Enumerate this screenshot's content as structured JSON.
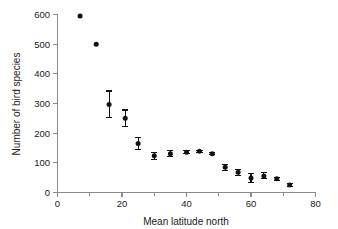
{
  "chart_data": {
    "type": "scatter",
    "title": "",
    "xlabel": "Mean latitude north",
    "ylabel": "Number of bird species",
    "xlim": [
      0,
      80
    ],
    "ylim": [
      0,
      600
    ],
    "grid": false,
    "legend": null,
    "x_ticks": [
      0,
      20,
      40,
      60,
      80
    ],
    "x_tick_labels": [
      "0",
      "20",
      "40",
      "60",
      "80"
    ],
    "x_minor_ticks": [
      10,
      30,
      50,
      70
    ],
    "y_ticks": [
      0,
      100,
      200,
      300,
      400,
      500,
      600
    ],
    "y_tick_labels": [
      "0",
      "100",
      "200",
      "300",
      "400",
      "500",
      "600"
    ],
    "marker_style": "filled-circle",
    "error_bar_style": "capped-vertical",
    "x": [
      7,
      12,
      16,
      21,
      25,
      30,
      35,
      40,
      44,
      48,
      52,
      56,
      60,
      64,
      68,
      72
    ],
    "values": [
      595,
      500,
      297,
      250,
      165,
      124,
      131,
      136,
      139,
      131,
      85,
      68,
      49,
      56,
      46,
      25
    ],
    "yerr": [
      0,
      0,
      45,
      28,
      20,
      12,
      10,
      5,
      4,
      3,
      10,
      10,
      14,
      10,
      5,
      4
    ],
    "series": [
      {
        "name": "bird species richness",
        "points": [
          {
            "x": 7,
            "y": 595,
            "err": 0
          },
          {
            "x": 12,
            "y": 500,
            "err": 0
          },
          {
            "x": 16,
            "y": 297,
            "err": 45
          },
          {
            "x": 21,
            "y": 250,
            "err": 28
          },
          {
            "x": 25,
            "y": 165,
            "err": 20
          },
          {
            "x": 30,
            "y": 124,
            "err": 12
          },
          {
            "x": 35,
            "y": 131,
            "err": 10
          },
          {
            "x": 40,
            "y": 136,
            "err": 5
          },
          {
            "x": 44,
            "y": 139,
            "err": 4
          },
          {
            "x": 48,
            "y": 131,
            "err": 3
          },
          {
            "x": 52,
            "y": 85,
            "err": 10
          },
          {
            "x": 56,
            "y": 68,
            "err": 10
          },
          {
            "x": 60,
            "y": 49,
            "err": 14
          },
          {
            "x": 64,
            "y": 56,
            "err": 10
          },
          {
            "x": 68,
            "y": 46,
            "err": 5
          },
          {
            "x": 72,
            "y": 25,
            "err": 4
          }
        ]
      }
    ],
    "colors": {
      "marker": "#111111",
      "error_bar": "#111111",
      "axis": "#8a8a8a",
      "text": "#1a1a1a",
      "background": "#ffffff"
    }
  }
}
